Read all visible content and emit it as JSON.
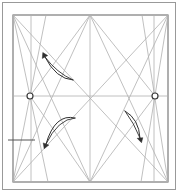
{
  "diagram": {
    "type": "origami-crease-pattern",
    "colors": {
      "background": "#ffffff",
      "frame": "#999999",
      "paper_border": "#6e6e6e",
      "crease": "#b0b0b0",
      "pinch_mark": "#555555",
      "circle_stroke": "#3a3a3a",
      "circle_fill": "#ffffff",
      "arrow": "#2f2f2f"
    },
    "square": {
      "left": 13,
      "top": 15,
      "right": 168,
      "bottom": 182
    },
    "creases": [
      [
        31,
        15,
        31,
        182
      ],
      [
        154,
        15,
        154,
        182
      ],
      [
        90,
        15,
        90,
        182
      ],
      [
        13,
        96,
        168,
        96
      ],
      [
        13,
        15,
        168,
        182
      ],
      [
        168,
        15,
        13,
        182
      ],
      [
        90,
        15,
        30,
        96
      ],
      [
        90,
        15,
        155,
        96
      ],
      [
        30,
        96,
        90,
        182
      ],
      [
        155,
        96,
        90,
        182
      ],
      [
        13,
        15,
        48,
        182
      ],
      [
        13,
        182,
        46,
        15
      ],
      [
        168,
        15,
        141,
        182
      ],
      [
        168,
        182,
        142,
        15
      ],
      [
        13,
        15,
        90,
        182
      ],
      [
        168,
        15,
        90,
        182
      ],
      [
        13,
        182,
        90,
        15
      ],
      [
        168,
        182,
        90,
        15
      ]
    ],
    "pinch_mark": [
      8,
      140,
      35,
      140
    ],
    "circles": [
      [
        30,
        96,
        3
      ],
      [
        155,
        96,
        3
      ]
    ],
    "arrows": [
      {
        "direction": "up-left",
        "outer": "M73,80 Q56,79 45,57",
        "inner": "M73,80 Q57,73 45,57",
        "head": "42.8,52.5 47.7,55.6 42.3,58.4"
      },
      {
        "direction": "down-left",
        "outer": "M75,118 Q55,113 46,144",
        "inner": "M75,118 Q58,119 46,144",
        "head": "44.2,148.7 48.8,145.1 43.2,142.9"
      },
      {
        "direction": "down-right",
        "outer": "M125,111 Q139,119 140,138",
        "inner": "M125,111 Q134,123 140,138",
        "head": "141.5,142.7 142.8,137.7 137.2,138.3"
      }
    ]
  }
}
